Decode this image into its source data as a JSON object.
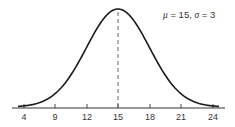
{
  "chart_data": {
    "type": "line",
    "title": "",
    "xlabel": "",
    "ylabel": "",
    "distribution": "normal",
    "mu": 15,
    "sigma": 3,
    "annotation": "μ = 15, σ = 3",
    "x_ticks": [
      4,
      9,
      12,
      15,
      18,
      21,
      24
    ],
    "x_tick_labels": [
      "4",
      "9",
      "12",
      "15",
      "18",
      "21",
      "24"
    ],
    "xlim": [
      3,
      25
    ],
    "mean_line": {
      "x": 15,
      "style": "dashed"
    },
    "grid": false,
    "legend": null,
    "colors": {
      "curve": "#1a1a1a",
      "axis": "#333333",
      "mean_line": "#555555"
    }
  },
  "annotation": {
    "mu_symbol": "μ",
    "mu_text": " = 15,  ",
    "sigma_symbol": "σ",
    "sigma_text": " = 3"
  },
  "axis": {
    "ticks": [
      {
        "label": "4",
        "px": 24
      },
      {
        "label": "9",
        "px": 55
      },
      {
        "label": "12",
        "px": 87
      },
      {
        "label": "15",
        "px": 118
      },
      {
        "label": "18",
        "px": 150
      },
      {
        "label": "21",
        "px": 181
      },
      {
        "label": "24",
        "px": 213
      }
    ]
  }
}
